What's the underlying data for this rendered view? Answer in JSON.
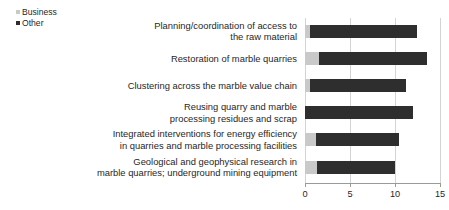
{
  "chart_data": {
    "type": "bar",
    "orientation": "horizontal",
    "stacked": true,
    "title": "",
    "xlabel": "",
    "ylabel": "",
    "xlim": [
      0,
      15
    ],
    "xticks": [
      0,
      5,
      10,
      15
    ],
    "xtick_labels": [
      "0",
      "5",
      "10",
      "15"
    ],
    "grid": true,
    "legend_position": "top-left",
    "categories": [
      "Planning/coordination of access to\nthe raw material",
      "Restoration of marble quarries",
      "Clustering across the marble value chain",
      "Reusing quarry and marble\nprocessing residues and scrap",
      "Integrated interventions for energy efficiency\nin quarries and marble processing facilities",
      "Geological and geophysical research in\nmarble quarries; underground mining equipment"
    ],
    "series": [
      {
        "name": "Business",
        "color": "#c9c9c9",
        "values": [
          0.5,
          1.5,
          0.6,
          0.0,
          1.2,
          1.3
        ]
      },
      {
        "name": "Other",
        "color": "#2e2e2e",
        "values": [
          11.9,
          12.0,
          10.6,
          12.0,
          9.3,
          8.7
        ]
      }
    ],
    "totals": [
      12.4,
      13.5,
      11.2,
      12.0,
      10.5,
      10.0
    ]
  },
  "legend": {
    "items": [
      {
        "label": "Business",
        "color": "#c9c9c9"
      },
      {
        "label": "Other",
        "color": "#2e2e2e"
      }
    ]
  },
  "axis": {
    "gridline_color": "#d4d4d4",
    "axis_color": "#9a9a9a"
  }
}
